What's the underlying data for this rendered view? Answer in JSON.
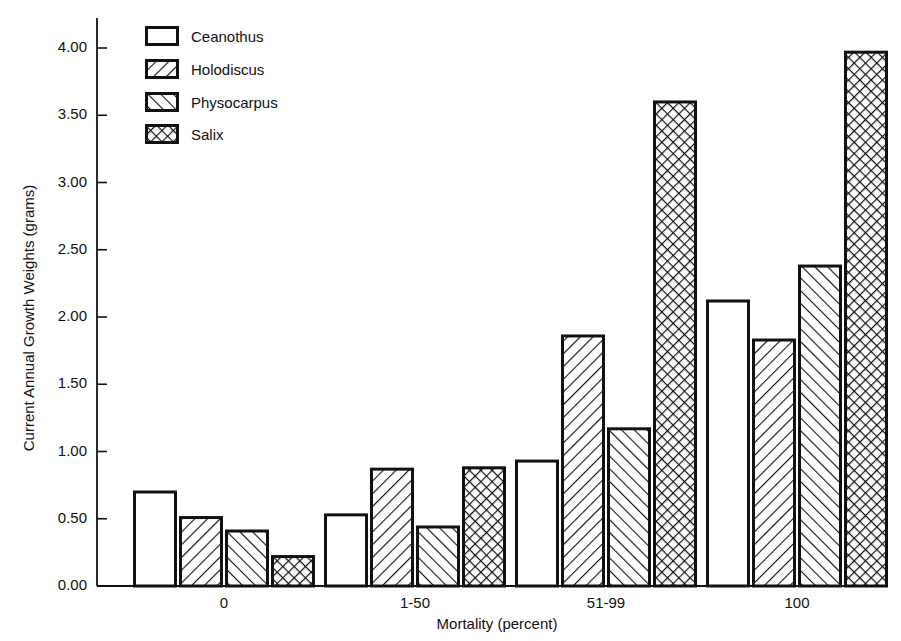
{
  "chart_data": {
    "type": "bar",
    "title": "",
    "xlabel": "Mortality (percent)",
    "ylabel": "Current Annual Growth Weights (grams)",
    "categories": [
      "0",
      "1-50",
      "51-99",
      "100"
    ],
    "series": [
      {
        "name": "Ceanothus",
        "pattern": "none",
        "values": [
          0.71,
          0.54,
          0.94,
          2.13
        ]
      },
      {
        "name": "Holodiscus",
        "pattern": "forward-diagonal",
        "values": [
          0.52,
          0.88,
          1.87,
          1.84
        ]
      },
      {
        "name": "Physocarpus",
        "pattern": "backward-diagonal",
        "values": [
          0.42,
          0.45,
          1.18,
          2.39
        ]
      },
      {
        "name": "Salix",
        "pattern": "crosshatch",
        "values": [
          0.23,
          0.89,
          3.61,
          3.98
        ]
      }
    ],
    "ylim": [
      0,
      4.0
    ],
    "yticks": [
      "0.00",
      "0.50",
      "1.00",
      "1.50",
      "2.00",
      "2.50",
      "3.00",
      "3.50",
      "4.00"
    ],
    "grid": false,
    "legend_position": "upper-left"
  },
  "legend": {
    "items": [
      {
        "label": "Ceanothus"
      },
      {
        "label": "Holodiscus"
      },
      {
        "label": "Physocarpus"
      },
      {
        "label": "Salix"
      }
    ]
  },
  "axes": {
    "x_label": "Mortality (percent)",
    "y_label": "Current Annual Growth Weights (grams)",
    "x_ticks": [
      "0",
      "1-50",
      "51-99",
      "100"
    ],
    "y_ticks": [
      "0.00",
      "0.50",
      "1.00",
      "1.50",
      "2.00",
      "2.50",
      "3.00",
      "3.50",
      "4.00"
    ]
  },
  "colors": {
    "ink": "#111111",
    "background": "#ffffff"
  }
}
